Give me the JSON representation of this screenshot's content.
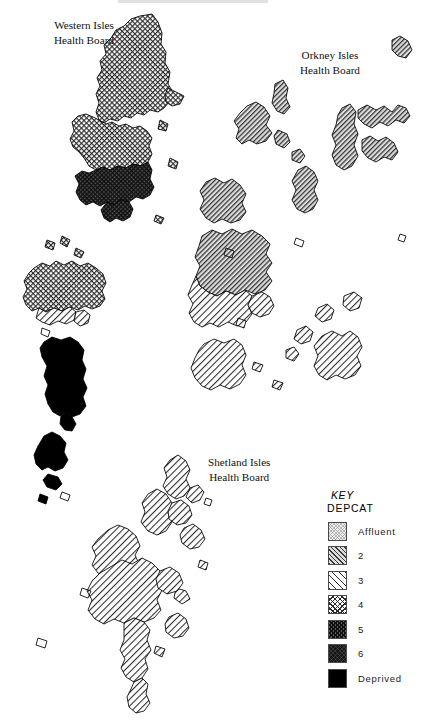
{
  "document": {
    "type": "choropleth-map",
    "description": "Deprivation category (DEPCAT) map of the Scottish island health boards",
    "width": 429,
    "height": 728,
    "background_color": "#ffffff",
    "outline_color": "#000000"
  },
  "labels": {
    "western": {
      "line1": "Western Isles",
      "line2": "Health Board"
    },
    "orkney": {
      "line1": "Orkney Isles",
      "line2": "Health Board"
    },
    "shetland": {
      "line1": "Shetland Isles",
      "line2": "Health Board"
    }
  },
  "legend": {
    "title": "KEY",
    "subtitle": "DEPCAT",
    "items": [
      {
        "label": "Affluent",
        "pattern": "fine-stipple-light",
        "swatch_class": "pat-1",
        "color": "#ededed"
      },
      {
        "label": "2",
        "pattern": "diagonal-hatch-dense",
        "swatch_class": "pat-2",
        "color": "#dcdcdc"
      },
      {
        "label": "3",
        "pattern": "diagonal-hatch-wide",
        "swatch_class": "pat-3",
        "color": "#ffffff"
      },
      {
        "label": "4",
        "pattern": "crosshatch",
        "swatch_class": "pat-4",
        "color": "#ffffff"
      },
      {
        "label": "5",
        "pattern": "crosshatch-dark",
        "swatch_class": "pat-5",
        "color": "#5a5a5a"
      },
      {
        "label": "6",
        "pattern": "near-solid-dark",
        "swatch_class": "pat-6",
        "color": "#151515"
      },
      {
        "label": "Deprived",
        "pattern": "solid-black",
        "swatch_class": "pat-7",
        "color": "#000000"
      }
    ]
  },
  "chart_data": {
    "type": "map",
    "legend_position": "bottom-right",
    "categories": [
      "Affluent",
      "2",
      "3",
      "4",
      "5",
      "6",
      "Deprived"
    ],
    "regions": [
      {
        "board": "Western Isles",
        "area": "Lewis (north)",
        "depcat": "4"
      },
      {
        "board": "Western Isles",
        "area": "Lewis (west)",
        "depcat": "4"
      },
      {
        "board": "Western Isles",
        "area": "Harris / Tarbert",
        "depcat": "5"
      },
      {
        "board": "Western Isles",
        "area": "North Uist / Benbecula",
        "depcat": "4"
      },
      {
        "board": "Western Isles",
        "area": "Benbecula strip",
        "depcat": "3"
      },
      {
        "board": "Western Isles",
        "area": "South Uist",
        "depcat": "Deprived"
      },
      {
        "board": "Western Isles",
        "area": "Barra / Vatersay",
        "depcat": "Deprived"
      },
      {
        "board": "Orkney Isles",
        "area": "Westray / Papa Westray",
        "depcat": "2"
      },
      {
        "board": "Orkney Isles",
        "area": "Sanday",
        "depcat": "2"
      },
      {
        "board": "Orkney Isles",
        "area": "Stronsay / Eday",
        "depcat": "2"
      },
      {
        "board": "Orkney Isles",
        "area": "Rousay",
        "depcat": "2"
      },
      {
        "board": "Orkney Isles",
        "area": "Mainland (north-west)",
        "depcat": "2"
      },
      {
        "board": "Orkney Isles",
        "area": "Mainland (south)",
        "depcat": "3"
      },
      {
        "board": "Orkney Isles",
        "area": "Hoy",
        "depcat": "3"
      },
      {
        "board": "Orkney Isles",
        "area": "South Ronaldsay",
        "depcat": "3"
      },
      {
        "board": "Orkney Isles",
        "area": "Shapinsay",
        "depcat": "2"
      },
      {
        "board": "Shetland Isles",
        "area": "Unst / Yell (north)",
        "depcat": "3"
      },
      {
        "board": "Shetland Isles",
        "area": "Mainland (north)",
        "depcat": "3"
      },
      {
        "board": "Shetland Isles",
        "area": "Mainland (central)",
        "depcat": "3"
      },
      {
        "board": "Shetland Isles",
        "area": "Mainland (south)",
        "depcat": "3"
      },
      {
        "board": "Shetland Isles",
        "area": "Whalsay / Bressay",
        "depcat": "3"
      }
    ]
  }
}
